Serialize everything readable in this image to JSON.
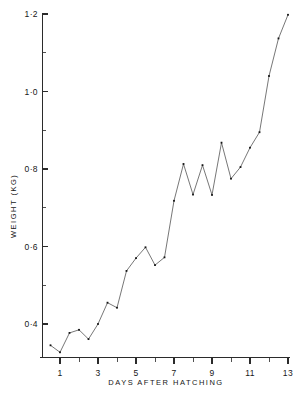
{
  "chart_data": {
    "type": "line",
    "title": "",
    "xlabel": "DAYS AFTER HATCHING",
    "ylabel": "WEIGHT (KG)",
    "xlim": [
      0.3,
      13.2
    ],
    "ylim": [
      0.32,
      1.22
    ],
    "grid": false,
    "legend": null,
    "x_ticks": [
      1,
      3,
      5,
      7,
      9,
      11,
      13
    ],
    "x_tick_labels": [
      "1",
      "3",
      "5",
      "7",
      "9",
      "11",
      "13"
    ],
    "x_minor_ticks": [
      2,
      4,
      6,
      8,
      10,
      12
    ],
    "y_ticks": [
      0.4,
      0.6,
      0.8,
      1.0,
      1.2
    ],
    "y_tick_labels": [
      "0·4",
      "0·6",
      "0·8",
      "1·0",
      "1·2"
    ],
    "y_minor_ticks": [
      0.5,
      0.7,
      0.9,
      1.1
    ],
    "marker": "square-dot",
    "series": [
      {
        "name": "weight",
        "x": [
          0.5,
          1.0,
          1.5,
          2.0,
          2.5,
          3.0,
          3.5,
          4.0,
          4.5,
          5.0,
          5.5,
          6.0,
          6.5,
          7.0,
          7.5,
          8.0,
          8.5,
          9.0,
          9.5,
          10.0,
          10.5,
          11.0,
          11.5,
          12.0,
          12.5,
          13.0
        ],
        "y": [
          0.345,
          0.327,
          0.377,
          0.385,
          0.361,
          0.4,
          0.455,
          0.442,
          0.537,
          0.57,
          0.598,
          0.552,
          0.572,
          0.718,
          0.813,
          0.734,
          0.81,
          0.733,
          0.868,
          0.775,
          0.805,
          0.855,
          0.895,
          1.04,
          1.137,
          1.198
        ]
      }
    ]
  },
  "labels": {
    "x_axis_title": "DAYS AFTER HATCHING",
    "y_axis_title": "WEIGHT (KG)"
  }
}
